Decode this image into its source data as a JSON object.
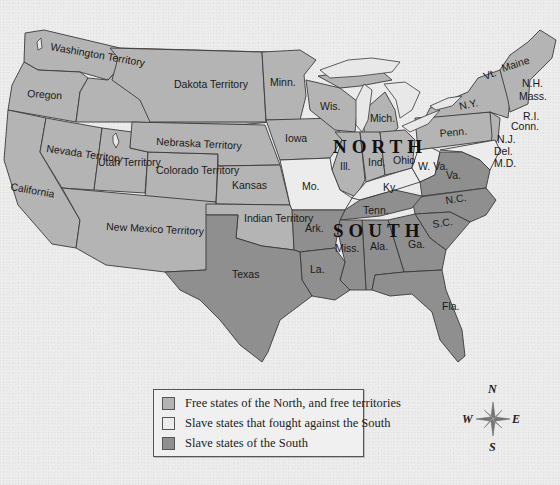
{
  "map": {
    "title_labels": {
      "north": "NORTH",
      "south": "SOUTH"
    },
    "regions": {
      "washington": "Washington Territory",
      "oregon": "Oregon",
      "california": "California",
      "nevada": "Nevada Territory",
      "utah": "Utah Territory",
      "colorado": "Colorado Territory",
      "dakota": "Dakota Territory",
      "nebraska": "Nebraska Territory",
      "kansas": "Kansas",
      "new_mexico": "New Mexico Territory",
      "indian": "Indian Territory",
      "texas": "Texas",
      "minnesota": "Minn.",
      "iowa": "Iowa",
      "wisconsin": "Wis.",
      "michigan": "Mich.",
      "illinois": "Ill.",
      "indiana": "Ind.",
      "ohio": "Ohio",
      "missouri": "Mo.",
      "kentucky": "Ky.",
      "west_virginia": "W. Va.",
      "virginia": "Va.",
      "pennsylvania": "Penn.",
      "new_york": "N.Y.",
      "vermont": "Vt.",
      "maine": "Maine",
      "new_hampshire": "N.H.",
      "massachusetts": "Mass.",
      "rhode_island": "R.I.",
      "connecticut": "Conn.",
      "new_jersey": "N.J.",
      "delaware": "Del.",
      "maryland": "M.D.",
      "north_carolina": "N.C.",
      "south_carolina": "S.C.",
      "tennessee": "Tenn.",
      "arkansas": "Ark.",
      "louisiana": "La.",
      "mississippi": "Miss.",
      "alabama": "Ala.",
      "georgia": "Ga.",
      "florida": "Fla."
    },
    "colors": {
      "free": "#b4b4b4",
      "border_slave": "#ececec",
      "slave": "#8f8f8f"
    }
  },
  "legend": {
    "items": [
      {
        "label": "Free states of the North, and free territories",
        "color": "#b4b4b4"
      },
      {
        "label": "Slave states that fought against the South",
        "color": "#ececec"
      },
      {
        "label": "Slave states of the South",
        "color": "#8f8f8f"
      }
    ]
  },
  "compass": {
    "n": "N",
    "e": "E",
    "s": "S",
    "w": "W"
  }
}
